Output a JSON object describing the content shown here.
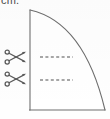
{
  "figure": {
    "unit_label": "cm.",
    "shape": {
      "name": "quarter-circle-panel",
      "stroke_color": "#6e6e6e",
      "fill_color": "#ffffff",
      "apex": {
        "x": 30,
        "y": 10
      },
      "base_left": {
        "x": 30,
        "y": 110
      },
      "base_right": {
        "x": 105,
        "y": 110
      },
      "arc_path": "M 30 10 Q 84 22 105 110"
    },
    "cut_lines": [
      {
        "name": "upper-cut-line",
        "x_start": 40,
        "x_end": 73,
        "y": 57,
        "style": "dashed",
        "color": "#8a8a8a"
      },
      {
        "name": "lower-cut-line",
        "x_start": 40,
        "x_end": 73,
        "y": 80,
        "style": "dashed",
        "color": "#8a8a8a"
      }
    ],
    "scissors": [
      {
        "name": "scissors-icon-upper",
        "x": 4,
        "y": 49,
        "direction": "right"
      },
      {
        "name": "scissors-icon-lower",
        "x": 4,
        "y": 71,
        "direction": "right"
      }
    ]
  },
  "colors": {
    "outline": "#6e6e6e",
    "dash": "#8a8a8a",
    "text": "#4b4b4b",
    "background": "#fefefe"
  }
}
